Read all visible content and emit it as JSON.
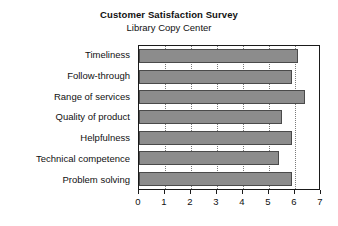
{
  "chart_data": {
    "type": "bar",
    "orientation": "horizontal",
    "title": "Customer Satisfaction Survey",
    "subtitle": "Library Copy Center",
    "xlabel": "",
    "ylabel": "",
    "xlim": [
      0,
      7
    ],
    "ylim": null,
    "grid": "vertical-dotted",
    "legend": null,
    "bar_color": "#8c8c8c",
    "bar_border_color": "#4a4a4a",
    "frame_color": "#1a1a1a",
    "gridline_color": "#7a7a7a",
    "categories": [
      "Timeliness",
      "Follow-through",
      "Range of services",
      "Quality of product",
      "Helpfulness",
      "Technical competence",
      "Problem solving"
    ],
    "values": [
      6.1,
      5.9,
      6.4,
      5.5,
      5.9,
      5.4,
      5.9
    ],
    "xticks": [
      0,
      1,
      2,
      3,
      4,
      5,
      6,
      7
    ],
    "xtick_labels": [
      "0",
      "1",
      "2",
      "3",
      "4",
      "5",
      "6",
      "7"
    ],
    "gridline_values": [
      1,
      2,
      3,
      4,
      5,
      6
    ]
  }
}
